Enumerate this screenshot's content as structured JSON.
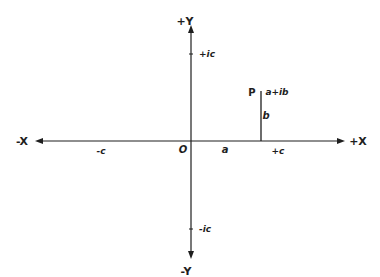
{
  "diagram": {
    "title": "",
    "type": "argand-diagram",
    "colors": {
      "ink": "#1e1e1e",
      "background": "#ffffff"
    },
    "axes": {
      "x_axis": {
        "positive_label": "+X",
        "negative_label": "-X",
        "positive_tick_label": "+c",
        "negative_tick_label": "-c"
      },
      "y_axis": {
        "positive_label": "+Y",
        "negative_label": "-Y",
        "positive_tick_label": "+ic",
        "negative_tick_label": "-ic"
      },
      "origin_label": "O"
    },
    "point": {
      "name": "P",
      "value_label": "a+ib",
      "real_part_label": "a",
      "imag_part_label": "b"
    }
  }
}
